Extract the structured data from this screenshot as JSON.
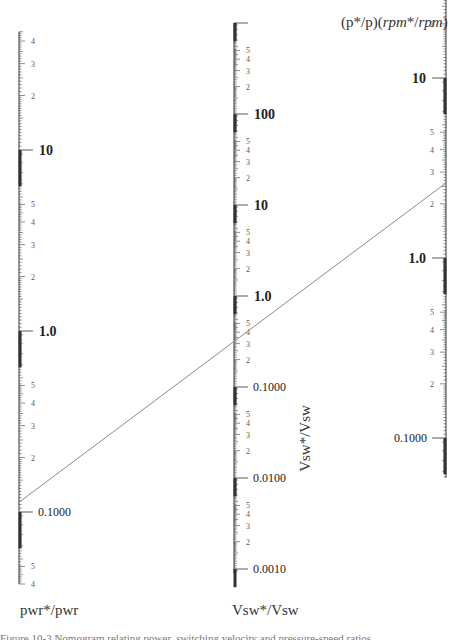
{
  "chart_data": {
    "type": "nomogram",
    "title": "",
    "axes": [
      {
        "name": "pwr*/pwr",
        "position": "left",
        "scale": "log",
        "x_px": 19,
        "decade_px": 181,
        "ref_value": 1.0,
        "ref_y_px": 331,
        "range": [
          0.04,
          45
        ],
        "decade_labels": [
          {
            "value": 10,
            "label": "10"
          },
          {
            "value": 1,
            "label": "1.0"
          },
          {
            "value": 0.1,
            "label": "0.1000"
          }
        ],
        "minor_labels": [
          "4",
          "3",
          "2",
          "9",
          "8",
          "7",
          "6",
          "5",
          "4",
          "3",
          "2",
          "9",
          "8",
          "7",
          "6",
          "5",
          "4",
          "3",
          "2",
          "9",
          "8",
          "7",
          "6",
          "5",
          "4"
        ],
        "bottom_label": "pwr*/pwr"
      },
      {
        "name": "Vsw*/Vsw",
        "position": "middle",
        "scale": "log",
        "x_px": 234,
        "decade_px": 91,
        "ref_value": 1.0,
        "ref_y_px": 296,
        "range": [
          0.0009,
          1000
        ],
        "decade_labels": [
          {
            "value": 100,
            "label": "100"
          },
          {
            "value": 10,
            "label": "10"
          },
          {
            "value": 1,
            "label": "1.0"
          },
          {
            "value": 0.1,
            "label": "0.1000"
          },
          {
            "value": 0.01,
            "label": "0.0100"
          },
          {
            "value": 0.001,
            "label": "0.0010"
          }
        ],
        "side_label": "Vsw*/Vsw",
        "bottom_label": "Vsw*/Vsw"
      },
      {
        "name": "(p*/p)(rpm*/rpm)",
        "position": "right",
        "scale": "log",
        "x_px": 446,
        "decade_px": 180,
        "ref_value": 1.0,
        "ref_y_px": 258,
        "range": [
          0.06,
          45
        ],
        "decade_labels": [
          {
            "value": 0.1,
            "label": "0.1000"
          },
          {
            "value": 1,
            "label": "1.0"
          },
          {
            "value": 10,
            "label": "10"
          }
        ],
        "top_label_plain": "(p*/p)(",
        "top_label_italic_1": "rpm",
        "top_label_mid": "*/",
        "top_label_italic_2": "rpm",
        "top_label_end": ")"
      }
    ],
    "isopleth": {
      "description": "straight line connecting the left and right scales, crossing the middle scale",
      "left_value": 0.12,
      "middle_value": 0.33,
      "right_value": 0.42,
      "from_px": [
        18,
        503
      ],
      "to_px": [
        446,
        183
      ],
      "color": "#8a8a8a"
    },
    "colors": {
      "axis": "#333333",
      "tick": "#444444",
      "minor_label": "#555555",
      "decade_label": "#222222",
      "line": "#8a8a8a"
    }
  },
  "labels": {
    "left_bottom": "pwr*/pwr",
    "middle_bottom": "Vsw*/Vsw",
    "middle_side": "Vsw*/Vsw",
    "right_top_a": "(p*/p)(",
    "right_top_b": "rpm",
    "right_top_c": "*/",
    "right_top_d": "rpm",
    "right_top_e": ")",
    "caption_cut": "Figure 10-3  Nomogram relating power, switching velocity and pressure-speed ratios"
  }
}
